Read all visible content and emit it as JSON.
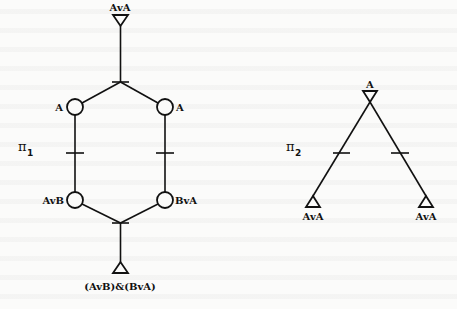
{
  "diagram": {
    "pi1": {
      "name": "π",
      "subscript": "1",
      "top_triangle_label": "AvA",
      "upper_left_node_label": "A",
      "upper_right_node_label": "A",
      "lower_left_node_label": "AvB",
      "lower_right_node_label": "BvA",
      "bottom_triangle_label": "(AvB)&(BvA)"
    },
    "pi2": {
      "name": "π",
      "subscript": "2",
      "top_triangle_label": "A",
      "bottom_left_triangle_label": "AvA",
      "bottom_right_triangle_label": "AvA"
    },
    "colors": {
      "ink": "#111111",
      "paper": "#fbfbfa"
    }
  }
}
